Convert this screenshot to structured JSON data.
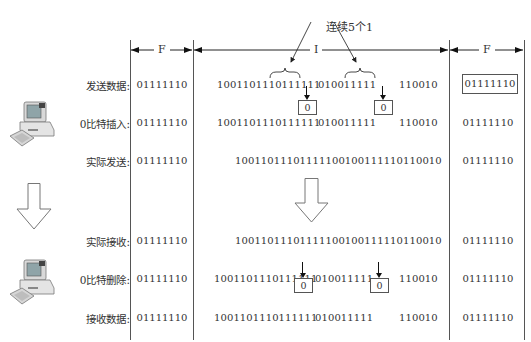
{
  "annotation": {
    "label": "连续5个1"
  },
  "segments": [
    {
      "label": "F",
      "role": "start-flag"
    },
    {
      "label": "I",
      "role": "information"
    },
    {
      "label": "F",
      "role": "end-flag"
    }
  ],
  "rows": [
    {
      "label": "发送数据:",
      "flag_start": "01111110",
      "data_parts": [
        "1001101110111111",
        "010011111",
        "110010"
      ],
      "flag_end": "01111110",
      "flag_end_boxed": true
    },
    {
      "label": "0比特插入:",
      "flag_start": "01111110",
      "data_parts": [
        "1001101110111111",
        "010011111",
        "110010"
      ],
      "flag_end": "01111110",
      "inserted_bits": [
        "0",
        "0"
      ]
    },
    {
      "label": "实际发送:",
      "flag_start": "01111110",
      "data": "10011011101111100100111110110010",
      "flag_end": "01111110"
    },
    {
      "label": "实际接收:",
      "flag_start": "01111110",
      "data": "10011011101111100100111110110010",
      "flag_end": "01111110"
    },
    {
      "label": "0比特删除:",
      "flag_start": "01111110",
      "data_parts": [
        "1001101110111111",
        "010011111",
        "110010"
      ],
      "flag_end": "01111110",
      "deleted_bits": [
        "0",
        "0"
      ]
    },
    {
      "label": "接收数据:",
      "flag_start": "01111110",
      "data_parts": [
        "1001101110111111",
        "010011111",
        "110010"
      ],
      "flag_end": "01111110"
    }
  ],
  "icons": {
    "sender": "computer-icon",
    "receiver": "computer-icon",
    "left_arrow": "down-arrow-icon",
    "center_arrow": "down-arrow-icon"
  }
}
